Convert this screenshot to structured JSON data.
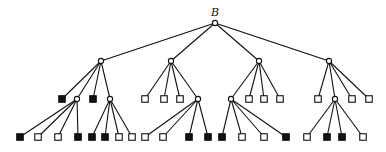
{
  "diagram": {
    "type": "game-tree",
    "root_label": "B",
    "nodes": [
      {
        "id": "root",
        "x": 215,
        "y": 23,
        "shape": "circle",
        "label": "B"
      },
      {
        "id": "a",
        "x": 101,
        "y": 61,
        "shape": "circle",
        "parent": "root"
      },
      {
        "id": "b",
        "x": 171,
        "y": 61,
        "shape": "circle",
        "parent": "root"
      },
      {
        "id": "c",
        "x": 259,
        "y": 61,
        "shape": "circle",
        "parent": "root"
      },
      {
        "id": "d",
        "x": 329,
        "y": 61,
        "shape": "circle",
        "parent": "root"
      },
      {
        "id": "a1",
        "x": 62,
        "y": 99,
        "shape": "square",
        "fill": "filled",
        "parent": "a"
      },
      {
        "id": "a2",
        "x": 77,
        "y": 99,
        "shape": "circle",
        "parent": "a"
      },
      {
        "id": "a3",
        "x": 93,
        "y": 99,
        "shape": "square",
        "fill": "filled",
        "parent": "a"
      },
      {
        "id": "a4",
        "x": 110,
        "y": 99,
        "shape": "circle",
        "parent": "a"
      },
      {
        "id": "b1",
        "x": 145,
        "y": 99,
        "shape": "square",
        "fill": "open",
        "parent": "b"
      },
      {
        "id": "b2",
        "x": 164,
        "y": 99,
        "shape": "square",
        "fill": "open",
        "parent": "b"
      },
      {
        "id": "b3",
        "x": 180,
        "y": 99,
        "shape": "square",
        "fill": "open",
        "parent": "b"
      },
      {
        "id": "b4",
        "x": 198,
        "y": 99,
        "shape": "circle",
        "parent": "b"
      },
      {
        "id": "c1",
        "x": 231,
        "y": 99,
        "shape": "circle",
        "parent": "c"
      },
      {
        "id": "c2",
        "x": 249,
        "y": 99,
        "shape": "square",
        "fill": "open",
        "parent": "c"
      },
      {
        "id": "c3",
        "x": 264,
        "y": 99,
        "shape": "square",
        "fill": "open",
        "parent": "c"
      },
      {
        "id": "c4",
        "x": 280,
        "y": 99,
        "shape": "square",
        "fill": "open",
        "parent": "c"
      },
      {
        "id": "d1",
        "x": 318,
        "y": 99,
        "shape": "square",
        "fill": "open",
        "parent": "d"
      },
      {
        "id": "d2",
        "x": 335,
        "y": 99,
        "shape": "circle",
        "parent": "d"
      },
      {
        "id": "d3",
        "x": 352,
        "y": 99,
        "shape": "square",
        "fill": "open",
        "parent": "d"
      },
      {
        "id": "d4",
        "x": 369,
        "y": 99,
        "shape": "square",
        "fill": "open",
        "parent": "d"
      },
      {
        "id": "a2a",
        "x": 20,
        "y": 137,
        "shape": "square",
        "fill": "filled",
        "parent": "a2"
      },
      {
        "id": "a2b",
        "x": 38,
        "y": 137,
        "shape": "square",
        "fill": "open",
        "parent": "a2"
      },
      {
        "id": "a2c",
        "x": 58,
        "y": 137,
        "shape": "square",
        "fill": "open",
        "parent": "a2"
      },
      {
        "id": "a2d",
        "x": 78,
        "y": 137,
        "shape": "square",
        "fill": "filled",
        "parent": "a2"
      },
      {
        "id": "a4a",
        "x": 92,
        "y": 137,
        "shape": "square",
        "fill": "filled",
        "parent": "a4"
      },
      {
        "id": "a4b",
        "x": 105,
        "y": 137,
        "shape": "square",
        "fill": "filled",
        "parent": "a4"
      },
      {
        "id": "a4c",
        "x": 119,
        "y": 137,
        "shape": "square",
        "fill": "open",
        "parent": "a4"
      },
      {
        "id": "a4d",
        "x": 132,
        "y": 137,
        "shape": "square",
        "fill": "open",
        "parent": "a4"
      },
      {
        "id": "b4a",
        "x": 145,
        "y": 137,
        "shape": "square",
        "fill": "open",
        "parent": "b4"
      },
      {
        "id": "b4b",
        "x": 163,
        "y": 137,
        "shape": "square",
        "fill": "open",
        "parent": "b4"
      },
      {
        "id": "b4c",
        "x": 189,
        "y": 137,
        "shape": "square",
        "fill": "filled",
        "parent": "b4"
      },
      {
        "id": "b4d",
        "x": 208,
        "y": 137,
        "shape": "square",
        "fill": "filled",
        "parent": "b4"
      },
      {
        "id": "c1a",
        "x": 222,
        "y": 137,
        "shape": "square",
        "fill": "filled",
        "parent": "c1"
      },
      {
        "id": "c1b",
        "x": 242,
        "y": 137,
        "shape": "square",
        "fill": "open",
        "parent": "c1"
      },
      {
        "id": "c1c",
        "x": 264,
        "y": 137,
        "shape": "square",
        "fill": "open",
        "parent": "c1"
      },
      {
        "id": "c1d",
        "x": 286,
        "y": 137,
        "shape": "square",
        "fill": "filled",
        "parent": "c1"
      },
      {
        "id": "d2a",
        "x": 307,
        "y": 137,
        "shape": "square",
        "fill": "open",
        "parent": "d2"
      },
      {
        "id": "d2b",
        "x": 327,
        "y": 137,
        "shape": "square",
        "fill": "filled",
        "parent": "d2"
      },
      {
        "id": "d2c",
        "x": 342,
        "y": 137,
        "shape": "square",
        "fill": "filled",
        "parent": "d2"
      },
      {
        "id": "d2d",
        "x": 363,
        "y": 137,
        "shape": "square",
        "fill": "open",
        "parent": "d2"
      }
    ]
  }
}
